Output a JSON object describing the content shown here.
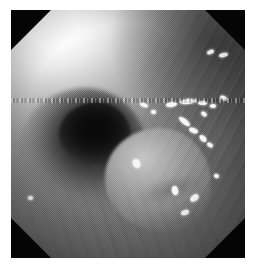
{
  "view": {
    "kind": "endoscopic-still-image",
    "modality_label": "",
    "background_color": "#ffffff",
    "frame": {
      "left": 11,
      "top": 10,
      "width": 234,
      "height": 248,
      "corner_mask_color": "#050505",
      "corner_mask_size": 40,
      "shape": "octagon"
    }
  },
  "image_content": {
    "palette": {
      "highlight_white": "#ffffff",
      "bright_mucosa": "#c6c6c6",
      "mid_mucosa": "#8d8d8d",
      "dark_wall": "#4a4a4a",
      "lumen_black": "#070707",
      "speck_white": "#f6f6f6"
    },
    "regions": [
      {
        "name": "blown-out-highlight",
        "description": "overexposed white glare, upper-left quadrant",
        "tone": "#ffffff"
      },
      {
        "name": "dark-lumen",
        "description": "dark round cavity opening, left of centre",
        "tone": "#070707"
      },
      {
        "name": "central-mass",
        "description": "rounded pale polypoid mass, centre of frame",
        "tone": "#b8b8b8"
      },
      {
        "name": "ridged-wall",
        "description": "striated mucosal folds along the right wall",
        "tone": "#5a5a5a"
      },
      {
        "name": "scanline-artifact",
        "description": "horizontal dashed interlace band across mid frame",
        "tone": "#d2d2d2"
      }
    ],
    "specular_specks": [
      {
        "x": 207,
        "y": 50,
        "w": 7,
        "h": 4,
        "rot": -22
      },
      {
        "x": 219,
        "y": 53,
        "w": 9,
        "h": 4,
        "rot": -14
      },
      {
        "x": 140,
        "y": 103,
        "w": 8,
        "h": 4,
        "rot": 22
      },
      {
        "x": 151,
        "y": 110,
        "w": 5,
        "h": 4,
        "rot": 10
      },
      {
        "x": 166,
        "y": 102,
        "w": 11,
        "h": 5,
        "rot": -8
      },
      {
        "x": 180,
        "y": 99,
        "w": 16,
        "h": 5,
        "rot": -6
      },
      {
        "x": 198,
        "y": 101,
        "w": 9,
        "h": 4,
        "rot": 4
      },
      {
        "x": 210,
        "y": 104,
        "w": 6,
        "h": 4,
        "rot": -4
      },
      {
        "x": 220,
        "y": 96,
        "w": 7,
        "h": 4,
        "rot": 28
      },
      {
        "x": 201,
        "y": 112,
        "w": 6,
        "h": 4,
        "rot": 34
      },
      {
        "x": 178,
        "y": 119,
        "w": 13,
        "h": 5,
        "rot": 38
      },
      {
        "x": 189,
        "y": 128,
        "w": 9,
        "h": 5,
        "rot": 22
      },
      {
        "x": 199,
        "y": 136,
        "w": 8,
        "h": 5,
        "rot": 46
      },
      {
        "x": 207,
        "y": 143,
        "w": 6,
        "h": 4,
        "rot": 30
      },
      {
        "x": 133,
        "y": 159,
        "w": 7,
        "h": 9,
        "rot": -26
      },
      {
        "x": 172,
        "y": 186,
        "w": 6,
        "h": 9,
        "rot": -14
      },
      {
        "x": 190,
        "y": 195,
        "w": 9,
        "h": 6,
        "rot": -38
      },
      {
        "x": 181,
        "y": 210,
        "w": 8,
        "h": 5,
        "rot": -20
      },
      {
        "x": 28,
        "y": 196,
        "w": 5,
        "h": 4,
        "rot": 0
      },
      {
        "x": 214,
        "y": 174,
        "w": 5,
        "h": 4,
        "rot": 18
      }
    ]
  }
}
